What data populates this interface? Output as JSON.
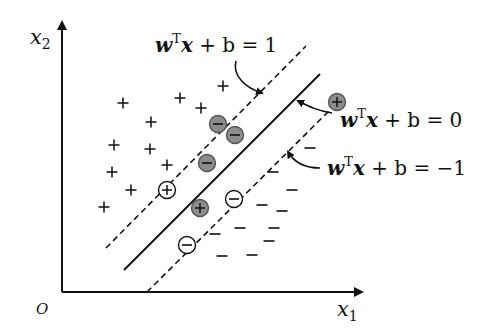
{
  "diagram": {
    "axes": {
      "x_label": "x",
      "x_sub": "1",
      "y_label": "x",
      "y_sub": "2",
      "origin_label": "O"
    },
    "annotations": {
      "margin_pos": {
        "w": "w",
        "sup": "T",
        "x": "x",
        "rest": " + b = 1"
      },
      "hyperplane": {
        "w": "w",
        "sup": "T",
        "x": "x",
        "rest": " + b = 0"
      },
      "margin_neg": {
        "w": "w",
        "sup": "T",
        "x": "x",
        "rest": " + b = −1"
      }
    },
    "symbols": {
      "plus": "+",
      "minus": "−"
    },
    "colors": {
      "ink": "#111111",
      "support_fill": "#8c8c8c",
      "background": "#ffffff"
    },
    "positive_points": [
      [
        123,
        103
      ],
      [
        180,
        98
      ],
      [
        201,
        108
      ],
      [
        223,
        86
      ],
      [
        151,
        122
      ],
      [
        114,
        145
      ],
      [
        150,
        149
      ],
      [
        167,
        165
      ],
      [
        112,
        172
      ],
      [
        131,
        190
      ],
      [
        104,
        207
      ]
    ],
    "negative_points": [
      [
        310,
        148
      ],
      [
        273,
        172
      ],
      [
        292,
        190
      ],
      [
        262,
        205
      ],
      [
        282,
        211
      ],
      [
        240,
        228
      ],
      [
        274,
        228
      ],
      [
        215,
        234
      ],
      [
        269,
        241
      ],
      [
        222,
        256
      ],
      [
        252,
        255
      ]
    ],
    "circled_points": [
      {
        "x": 218,
        "y": 124,
        "sign": "−",
        "filled": true
      },
      {
        "x": 235,
        "y": 135,
        "sign": "−",
        "filled": true
      },
      {
        "x": 207,
        "y": 163,
        "sign": "−",
        "filled": true
      },
      {
        "x": 200,
        "y": 208,
        "sign": "+",
        "filled": true
      },
      {
        "x": 337,
        "y": 102,
        "sign": "+",
        "filled": true
      },
      {
        "x": 167,
        "y": 190,
        "sign": "+",
        "filled": false
      },
      {
        "x": 234,
        "y": 199,
        "sign": "−",
        "filled": false
      },
      {
        "x": 187,
        "y": 245,
        "sign": "−",
        "filled": false
      }
    ]
  }
}
